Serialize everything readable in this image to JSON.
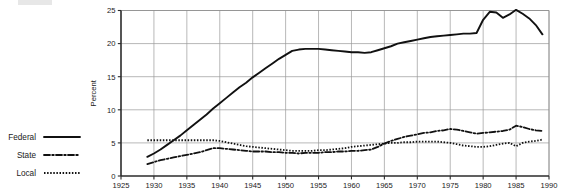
{
  "chart_data": {
    "type": "line",
    "title": "",
    "subtitle": "",
    "xlabel": "",
    "ylabel": "Percent",
    "xlim": [
      1925,
      1990
    ],
    "ylim": [
      0,
      25
    ],
    "xticks": [
      1925,
      1930,
      1935,
      1940,
      1945,
      1950,
      1955,
      1960,
      1965,
      1970,
      1975,
      1980,
      1985,
      1990
    ],
    "yticks": [
      0,
      5,
      10,
      15,
      20,
      25
    ],
    "xtick_labels": [
      "1925",
      "1930",
      "1935",
      "1940",
      "1945",
      "1950",
      "1955",
      "1960",
      "1965",
      "1970",
      "1975",
      "1980",
      "1985",
      "1990"
    ],
    "ytick_labels": [
      "0",
      "5",
      "10",
      "15",
      "20",
      "25"
    ],
    "grid": true,
    "grid_axis": "both",
    "legend_position": "left-outside",
    "x": [
      1929,
      1930,
      1931,
      1932,
      1933,
      1934,
      1935,
      1936,
      1937,
      1938,
      1939,
      1940,
      1941,
      1942,
      1943,
      1944,
      1945,
      1946,
      1947,
      1948,
      1949,
      1950,
      1951,
      1952,
      1953,
      1954,
      1955,
      1956,
      1957,
      1958,
      1959,
      1960,
      1961,
      1962,
      1963,
      1964,
      1965,
      1966,
      1967,
      1968,
      1969,
      1970,
      1971,
      1972,
      1973,
      1974,
      1975,
      1976,
      1977,
      1978,
      1979,
      1980,
      1981,
      1982,
      1983,
      1984,
      1985,
      1986,
      1987,
      1988,
      1989
    ],
    "series": [
      {
        "name": "Federal",
        "style": "solid",
        "color": "#111111",
        "values": [
          2.9,
          3.4,
          4.0,
          4.7,
          5.4,
          6.1,
          6.9,
          7.7,
          8.5,
          9.3,
          10.2,
          11.0,
          11.8,
          12.6,
          13.4,
          14.1,
          14.9,
          15.6,
          16.3,
          17.0,
          17.7,
          18.3,
          18.9,
          19.1,
          19.2,
          19.2,
          19.2,
          19.1,
          19.0,
          18.9,
          18.8,
          18.7,
          18.7,
          18.6,
          18.7,
          19.0,
          19.3,
          19.6,
          20.0,
          20.2,
          20.4,
          20.6,
          20.8,
          21.0,
          21.1,
          21.2,
          21.3,
          21.4,
          21.5,
          21.5,
          21.6,
          23.6,
          24.8,
          24.7,
          23.9,
          24.4,
          25.1,
          24.5,
          23.8,
          22.8,
          21.4
        ]
      },
      {
        "name": "State",
        "style": "dash-dot",
        "color": "#111111",
        "values": [
          1.8,
          2.1,
          2.4,
          2.6,
          2.8,
          3.0,
          3.2,
          3.4,
          3.6,
          3.9,
          4.2,
          4.2,
          4.1,
          4.0,
          3.9,
          3.8,
          3.7,
          3.7,
          3.7,
          3.6,
          3.6,
          3.5,
          3.5,
          3.4,
          3.5,
          3.5,
          3.5,
          3.6,
          3.6,
          3.7,
          3.7,
          3.8,
          3.8,
          3.9,
          4.0,
          4.4,
          4.9,
          5.3,
          5.6,
          5.9,
          6.1,
          6.3,
          6.5,
          6.6,
          6.8,
          6.9,
          7.1,
          7.0,
          6.8,
          6.6,
          6.4,
          6.5,
          6.6,
          6.7,
          6.8,
          7.0,
          7.6,
          7.4,
          7.1,
          6.9,
          6.8
        ]
      },
      {
        "name": "Local",
        "style": "dotted",
        "color": "#111111",
        "values": [
          5.4,
          5.4,
          5.4,
          5.4,
          5.4,
          5.4,
          5.4,
          5.4,
          5.4,
          5.4,
          5.4,
          5.3,
          5.1,
          4.9,
          4.7,
          4.5,
          4.4,
          4.3,
          4.2,
          4.1,
          4.0,
          3.9,
          3.8,
          3.8,
          3.8,
          3.8,
          3.9,
          3.9,
          4.0,
          4.1,
          4.2,
          4.4,
          4.5,
          4.6,
          4.7,
          4.8,
          4.9,
          5.0,
          5.0,
          5.1,
          5.1,
          5.2,
          5.2,
          5.2,
          5.2,
          5.1,
          5.0,
          4.8,
          4.6,
          4.5,
          4.4,
          4.4,
          4.5,
          4.7,
          4.9,
          5.0,
          4.5,
          5.0,
          5.2,
          5.3,
          5.5
        ]
      }
    ],
    "legend": [
      {
        "label": "Federal",
        "style": "solid"
      },
      {
        "label": "State",
        "style": "dash-dot"
      },
      {
        "label": "Local",
        "style": "dotted"
      }
    ]
  }
}
